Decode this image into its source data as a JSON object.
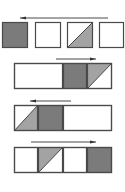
{
  "colors": {
    "background": "#ffffff",
    "border": "#4a4a4a",
    "dark_fill": "#7b7b7b",
    "triangle_fill": "#a3a3a3",
    "arrow": "#333333"
  },
  "rows": [
    {
      "type": "separate-squares",
      "arrow": {
        "direction": "left",
        "x1": 20,
        "x2": 108,
        "y": 18
      },
      "cells": [
        {
          "x": 2,
          "y": 22,
          "w": 26,
          "h": 26,
          "fill": "dark"
        },
        {
          "x": 35,
          "y": 22,
          "w": 26,
          "h": 26,
          "fill": "none"
        },
        {
          "x": 67,
          "y": 22,
          "w": 26,
          "h": 26,
          "fill": "triangle-lower-right"
        },
        {
          "x": 99,
          "y": 22,
          "w": 25,
          "h": 26,
          "fill": "none"
        }
      ]
    },
    {
      "type": "strip",
      "arrow": {
        "direction": "right",
        "x1": 56,
        "x2": 96,
        "y": 59
      },
      "strip": {
        "x": 14,
        "y": 63,
        "w": 98,
        "h": 26
      },
      "cells": [
        {
          "x": 14,
          "w": 49,
          "fill": "none"
        },
        {
          "x": 63,
          "w": 24,
          "fill": "dark"
        },
        {
          "x": 87,
          "w": 25,
          "fill": "triangle-upper-left"
        }
      ]
    },
    {
      "type": "strip",
      "arrow": {
        "direction": "left",
        "x1": 30,
        "x2": 71,
        "y": 101
      },
      "strip": {
        "x": 14,
        "y": 105,
        "w": 98,
        "h": 26
      },
      "cells": [
        {
          "x": 14,
          "w": 24,
          "fill": "triangle-lower-right"
        },
        {
          "x": 38,
          "w": 25,
          "fill": "dark"
        },
        {
          "x": 63,
          "w": 49,
          "fill": "none"
        }
      ]
    },
    {
      "type": "strip",
      "arrow": {
        "direction": "right",
        "x1": 31,
        "x2": 96,
        "y": 142
      },
      "strip": {
        "x": 14,
        "y": 147,
        "w": 98,
        "h": 26
      },
      "cells": [
        {
          "x": 14,
          "w": 24,
          "fill": "none"
        },
        {
          "x": 38,
          "w": 25,
          "fill": "triangle-upper-left"
        },
        {
          "x": 63,
          "w": 24,
          "fill": "none"
        },
        {
          "x": 87,
          "w": 25,
          "fill": "dark"
        }
      ]
    }
  ]
}
